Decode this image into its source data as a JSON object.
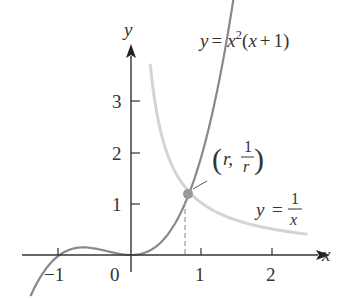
{
  "figure": {
    "axes": {
      "x_label": "x",
      "y_label": "y",
      "x_ticks": [
        "−1",
        "1",
        "2"
      ],
      "origin_label": "0",
      "y_ticks": [
        "1",
        "2",
        "3"
      ]
    },
    "curves": {
      "cubic": {
        "label_lhs": "y =",
        "label_x": "x",
        "label_exp": "2",
        "label_rest": "(x + 1)",
        "color": "#888888"
      },
      "hyperbola": {
        "label_lhs": "y =",
        "label_num": "1",
        "label_den": "x",
        "color": "#d4d4d4"
      }
    },
    "intersection": {
      "label_r": "r,",
      "label_num": "1",
      "label_den": "r",
      "point_color": "#999999"
    }
  },
  "chart_data": {
    "type": "line",
    "title": "",
    "xlabel": "x",
    "ylabel": "y",
    "xlim": [
      -1.4,
      2.5
    ],
    "ylim": [
      -0.5,
      4.0
    ],
    "x_ticks": [
      -1,
      1,
      2
    ],
    "y_ticks": [
      1,
      2,
      3
    ],
    "grid": false,
    "series": [
      {
        "name": "y = x^2(x + 1)",
        "function": "x^2*(x+1)",
        "domain": [
          -1.4,
          1.45
        ],
        "x": [
          -1.4,
          -1.0,
          -0.667,
          -0.5,
          0,
          0.5,
          0.755,
          1.0,
          1.3
        ],
        "y": [
          -0.78,
          0,
          0.148,
          0.125,
          0,
          0.375,
          1.32,
          2.0,
          3.89
        ]
      },
      {
        "name": "y = 1/x",
        "function": "1/x",
        "domain": [
          0.27,
          2.45
        ],
        "x": [
          0.27,
          0.5,
          0.755,
          1.0,
          1.5,
          2.0,
          2.45
        ],
        "y": [
          3.7,
          2.0,
          1.32,
          1.0,
          0.667,
          0.5,
          0.408
        ]
      }
    ],
    "annotations": [
      {
        "text": "(r, 1/r)",
        "x": 0.755,
        "y": 1.32,
        "type": "intersection point with dashed drop line to x-axis"
      }
    ]
  }
}
